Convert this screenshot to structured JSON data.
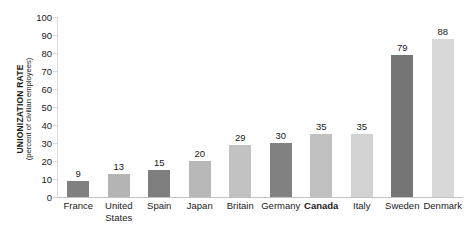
{
  "chart_data": {
    "type": "bar",
    "title": "",
    "subtitle": "",
    "xlabel": "",
    "ylabel": "UNIONIZATION RATE",
    "ylabel_sub": "(percent of civilian employees)",
    "ylim": [
      0,
      100
    ],
    "yticks": [
      100,
      90,
      80,
      70,
      60,
      50,
      40,
      30,
      20,
      10,
      0
    ],
    "grid": false,
    "legend": "none",
    "categories": [
      "France",
      "United States",
      "Spain",
      "Japan",
      "Britain",
      "Germany",
      "Canada",
      "Italy",
      "Sweden",
      "Denmark"
    ],
    "values": [
      9,
      13,
      15,
      20,
      29,
      30,
      35,
      35,
      79,
      88
    ],
    "bar_colors": [
      "#808080",
      "#b4b4b4",
      "#7e7e7e",
      "#b8b8b8",
      "#c2c2c2",
      "#828282",
      "#c0c0c0",
      "#d2d2d2",
      "#757575",
      "#d8d8d8"
    ],
    "emphasized_category": "Canada",
    "value_label_color": "#1a1a1a",
    "axis_color": "#c2c2c2",
    "background": "#ffffff"
  }
}
